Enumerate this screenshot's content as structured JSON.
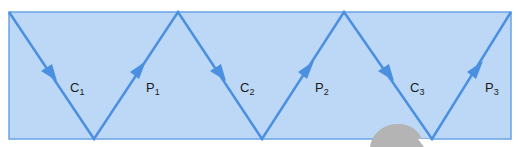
{
  "diagram": {
    "colors": {
      "box_fill": "#bcd8f6",
      "box_stroke": "#6aa3e6",
      "path_stroke": "#4a8fe0",
      "label_text": "#1a1a1a",
      "blob_fill": "#b4b4b4"
    },
    "box": {
      "x": 9,
      "y": 12,
      "width": 502,
      "height": 127
    },
    "zigzag_points": [
      [
        9,
        12
      ],
      [
        94,
        139
      ],
      [
        178,
        12
      ],
      [
        262,
        139
      ],
      [
        344,
        12
      ],
      [
        432,
        139
      ],
      [
        511,
        12
      ]
    ],
    "labels": [
      {
        "id": "C1",
        "main": "C",
        "sub": "1",
        "x": 123,
        "y": 66
      },
      {
        "id": "P1",
        "main": "P",
        "sub": "1",
        "x": 143,
        "y": 83
      },
      {
        "id": "C2",
        "main": "C",
        "sub": "2",
        "x": 237,
        "y": 83
      },
      {
        "id": "P2",
        "main": "P",
        "sub": "2",
        "x": 317,
        "y": 83
      },
      {
        "id": "C3",
        "main": "C",
        "sub": "3",
        "x": 407,
        "y": 83
      },
      {
        "id": "P3",
        "main": "P",
        "sub": "3",
        "x": 484,
        "y": 83
      }
    ],
    "arrows": [
      {
        "segment": "down-1",
        "direction": "down"
      },
      {
        "segment": "up-1",
        "direction": "up"
      },
      {
        "segment": "down-2",
        "direction": "down"
      },
      {
        "segment": "up-2",
        "direction": "up"
      },
      {
        "segment": "down-3",
        "direction": "down"
      },
      {
        "segment": "up-3",
        "direction": "up"
      }
    ]
  }
}
